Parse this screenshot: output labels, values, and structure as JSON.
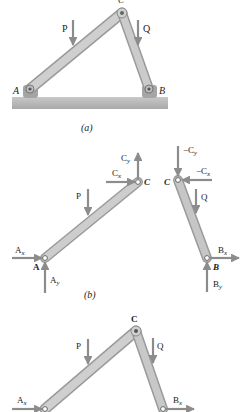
{
  "figure": {
    "panels": [
      {
        "id": "a",
        "caption": "(a)",
        "description": "Two-member frame ABC pinned to ground at A and B, loads P and Q",
        "labels": {
          "A": "A",
          "B": "B",
          "C": "C",
          "P": "P",
          "Q": "Q"
        }
      },
      {
        "id": "b",
        "caption": "(b)",
        "description": "Free-body diagrams of members AC and BC",
        "member_AC": {
          "labels": {
            "A": "A",
            "C": "C",
            "P": "P",
            "Ax": "A",
            "Ax_sub": "x",
            "Ay": "A",
            "Ay_sub": "y",
            "Cx": "C",
            "Cx_sub": "x",
            "Cy": "C",
            "Cy_sub": "y"
          }
        },
        "member_BC": {
          "labels": {
            "B": "B",
            "C": "C",
            "Q": "Q",
            "nCx": "−C",
            "nCx_sub": "x",
            "nCy": "−C",
            "nCy_sub": "y",
            "Bx": "B",
            "Bx_sub": "x",
            "By": "B",
            "By_sub": "y"
          }
        }
      },
      {
        "id": "c",
        "description": "Frame ABC with horizontal reactions Ax and Bx (partially visible)",
        "labels": {
          "C": "C",
          "P": "P",
          "Q": "Q",
          "Ax": "A",
          "Ax_sub": "x",
          "Bx": "B",
          "Bx_sub": "x"
        }
      }
    ],
    "colors": {
      "member_fill": "#c4c4c4",
      "member_stroke": "#8a8a8a",
      "arrow": "#8c8c8c",
      "ground": "#bdbdbd",
      "text": "#222222"
    }
  }
}
